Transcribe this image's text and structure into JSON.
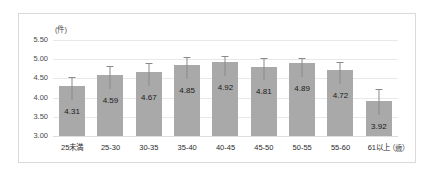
{
  "chart_data": {
    "type": "bar",
    "title": "",
    "subtitle": "",
    "xlabel": "",
    "ylabel": "",
    "y_unit_label": "(件)",
    "x_unit_label": "（歳）",
    "categories": [
      "25未満",
      "25-30",
      "30-35",
      "35-40",
      "40-45",
      "45-50",
      "50-55",
      "55-60",
      "61以上"
    ],
    "values": [
      4.31,
      4.59,
      4.67,
      4.85,
      4.92,
      4.81,
      4.89,
      4.72,
      3.92
    ],
    "value_labels": [
      "4.31",
      "4.59",
      "4.67",
      "4.85",
      "4.92",
      "4.81",
      "4.89",
      "4.72",
      "3.92"
    ],
    "errors_upper": [
      0.22,
      0.22,
      0.24,
      0.21,
      0.17,
      0.21,
      0.15,
      0.2,
      0.3
    ],
    "ylim": [
      3.0,
      5.5
    ],
    "ytick_labels": [
      "5.50",
      "5.00",
      "4.50",
      "4.00",
      "3.50",
      "3.00"
    ],
    "ytick_values": [
      5.5,
      5.0,
      4.5,
      4.0,
      3.5,
      3.0
    ],
    "grid": true,
    "legend": "none",
    "bar_color": "#a9a9a9",
    "grid_color": "#e8e8e8",
    "error_bar_color": "#8a8a8a",
    "border_color": "#d9d9d9"
  }
}
